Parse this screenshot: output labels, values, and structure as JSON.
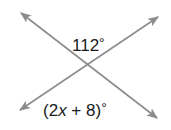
{
  "diagram": {
    "type": "intersecting-lines",
    "line_color": "#8c8c8c",
    "text_color": "#1a1a1a",
    "angles": {
      "top": {
        "text_prefix": "112",
        "degree": "°"
      },
      "bottom": {
        "open": "(2",
        "var": "x",
        "rest": " + 8)",
        "degree": "°"
      }
    }
  }
}
